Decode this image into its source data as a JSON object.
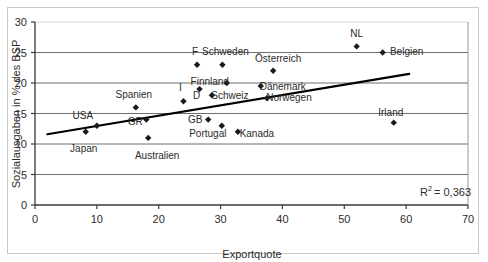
{
  "figure": {
    "clipped_text_above": "·  ·",
    "background": "#ffffff",
    "frame_color": "#c9c9c9"
  },
  "annotations": {
    "r2_text": "R",
    "r2_exponent": "2",
    "r2_value": "= 0,363"
  },
  "chart_data": {
    "type": "scatter",
    "title": "",
    "xlabel": "Exportquote",
    "ylabel": "Sozialausgaben in % des BSP",
    "xlim": [
      0,
      70
    ],
    "ylim": [
      0,
      30
    ],
    "xticks": [
      0,
      10,
      20,
      30,
      40,
      50,
      60,
      70
    ],
    "yticks": [
      0,
      5,
      10,
      15,
      20,
      25,
      30
    ],
    "xtick_labels": [
      "0",
      "10",
      "20",
      "30",
      "40",
      "50",
      "60",
      "70"
    ],
    "ytick_labels": [
      "0",
      "5",
      "10",
      "15",
      "20",
      "25",
      "30"
    ],
    "grid": "horizontal",
    "legend": "none",
    "marker": "diamond",
    "marker_color": "#1a1a1a",
    "trendline": {
      "visible": true,
      "color": "#000000",
      "x_start": 2,
      "y_start": 11.6,
      "x_end": 60.5,
      "y_end": 21.5
    },
    "points": [
      {
        "label": "Japan",
        "x": 8.2,
        "y": 12.0,
        "label_dx": -2,
        "label_dy": 20,
        "anchor": "middle"
      },
      {
        "label": "USA",
        "x": 10.0,
        "y": 13.0,
        "label_dx": -14,
        "label_dy": -7,
        "anchor": "middle"
      },
      {
        "label": "Spanien",
        "x": 16.3,
        "y": 16.0,
        "label_dx": -2,
        "label_dy": -9,
        "anchor": "middle"
      },
      {
        "label": "GR",
        "x": 18.0,
        "y": 14.0,
        "label_dx": -11,
        "label_dy": 5,
        "anchor": "middle"
      },
      {
        "label": "Australien",
        "x": 18.3,
        "y": 11.0,
        "label_dx": 9,
        "label_dy": 21,
        "anchor": "middle"
      },
      {
        "label": "I",
        "x": 24.0,
        "y": 17.0,
        "label_dx": -3,
        "label_dy": -10,
        "anchor": "middle"
      },
      {
        "label": "F",
        "x": 26.2,
        "y": 23.0,
        "label_dx": -2,
        "label_dy": -10,
        "anchor": "middle"
      },
      {
        "label": "D",
        "x": 26.6,
        "y": 19.0,
        "label_dx": -3,
        "label_dy": 10,
        "anchor": "middle"
      },
      {
        "label": "Schweden",
        "x": 30.3,
        "y": 23.0,
        "label_dx": 3,
        "label_dy": -10,
        "anchor": "middle"
      },
      {
        "label": "Portugal",
        "x": 30.2,
        "y": 13.0,
        "label_dx": -14,
        "label_dy": 11,
        "anchor": "middle"
      },
      {
        "label": "GB",
        "x": 28.0,
        "y": 14.0,
        "label_dx": -13,
        "label_dy": 3,
        "anchor": "middle"
      },
      {
        "label": "Schweiz",
        "x": 28.6,
        "y": 18.0,
        "label_dx": 18,
        "label_dy": 4,
        "anchor": "middle"
      },
      {
        "label": "Finnland",
        "x": 31.0,
        "y": 20.0,
        "label_dx": -17,
        "label_dy": 2,
        "anchor": "middle"
      },
      {
        "label": "Kanada",
        "x": 32.8,
        "y": 12.0,
        "label_dx": 19,
        "label_dy": 5,
        "anchor": "middle"
      },
      {
        "label": "Österreich",
        "x": 38.5,
        "y": 22.0,
        "label_dx": 5,
        "label_dy": -9,
        "anchor": "middle"
      },
      {
        "label": "Dänemark",
        "x": 36.5,
        "y": 19.5,
        "label_dx": 22,
        "label_dy": 4,
        "anchor": "middle"
      },
      {
        "label": "Norwegen",
        "x": 37.5,
        "y": 17.5,
        "label_dx": 22,
        "label_dy": 3,
        "anchor": "middle"
      },
      {
        "label": "NL",
        "x": 52.0,
        "y": 26.0,
        "label_dx": 0,
        "label_dy": -9,
        "anchor": "middle"
      },
      {
        "label": "Belgien",
        "x": 56.2,
        "y": 25.0,
        "label_dx": 24,
        "label_dy": 2,
        "anchor": "middle"
      },
      {
        "label": "Irland",
        "x": 58.0,
        "y": 13.5,
        "label_dx": -3,
        "label_dy": -7,
        "anchor": "middle"
      }
    ]
  }
}
